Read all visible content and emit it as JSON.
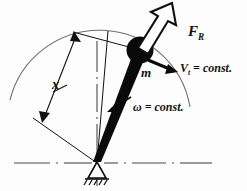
{
  "figure": {
    "labels": {
      "resultant_force": "F",
      "resultant_force_sub": "R",
      "mass": "m",
      "velocity": "V",
      "velocity_sub": "t",
      "velocity_eq": " = const.",
      "omega": "ω",
      "omega_eq": " = const.",
      "dimension_x": "x"
    },
    "colors": {
      "ink": "#111111",
      "paper": "#fdfdfd",
      "arc": "#555555",
      "centerline": "#666666"
    },
    "elements": {
      "mass_marker": "filled-circle",
      "force_arrow": "hollow-outline-arrow",
      "velocity_arrow": "solid-arrow",
      "omega_arrow": "solid-arrow",
      "support": "pin-support-hatched",
      "trajectory": "circular-arc",
      "dimension_line": "double-arrow",
      "ground_line": "dash-dot-centerline",
      "vertical_axis": "dash-dot-centerline"
    },
    "geometry": {
      "pivot_x": 97,
      "pivot_y": 163,
      "mass_x": 140,
      "mass_y": 50,
      "mass_radius": 13,
      "arc_radius": 92
    }
  }
}
